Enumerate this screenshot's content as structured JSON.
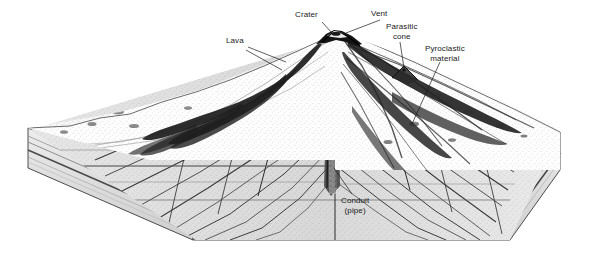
{
  "figure": {
    "type": "geological-block-diagram",
    "background_color": "#ffffff",
    "ink_color": "#1a1a1a"
  },
  "labels": {
    "lava": "Lava",
    "crater": "Crater",
    "vent": "Vent",
    "parasitic_cone_line1": "Parasitic",
    "parasitic_cone_line2": "cone",
    "pyroclastic_line1": "Pyroclastic",
    "pyroclastic_line2": "material",
    "conduit_line1": "Conduit",
    "conduit_line2": "(pipe)"
  },
  "parts": {
    "cone": "stratovolcano-cone",
    "cutaway_face": "interior-cross-section",
    "conduit": "central-conduit-pipe",
    "summit_crater": "summit-crater",
    "vent": "summit-vent",
    "parasitic_cone": "flank-parasitic-cone",
    "lava_flows": "dark-lava-flow-lobes",
    "pyroclastic_layers": "pyroclastic-deposit-layers",
    "basement_strata": "horizontal-sedimentary-strata",
    "block_left_face": "left-block-side-face",
    "block_right_face": "right-block-side-face",
    "block_base": "block-base-slab"
  }
}
